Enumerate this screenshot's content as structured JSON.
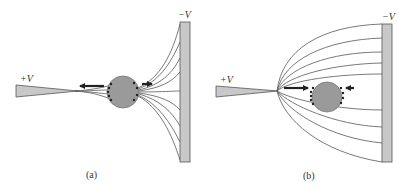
{
  "figure": {
    "panels": [
      {
        "id": "a",
        "caption": "(a)",
        "tip_label": "+V",
        "plate_label": "−V",
        "description": "Field lines from sharp tip converge near the particle; strong force toward tip, weak force toward plate"
      },
      {
        "id": "b",
        "caption": "(b)",
        "tip_label": "+V",
        "plate_label": "−V",
        "description": "Field lines spread from the tip to the plate; forces push the polarized particle from both sides"
      }
    ],
    "colors": {
      "field_line": "#6a6a6a",
      "plate_fill": "#c8c8c8",
      "plate_stroke": "#555555",
      "sphere_fill": "#9a9a9a",
      "arrow": "#222222",
      "text": "#333333"
    }
  }
}
